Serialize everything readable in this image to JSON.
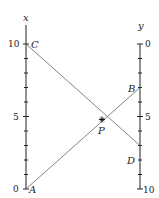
{
  "diagram": {
    "type": "nomogram",
    "left_axis": {
      "label": "x",
      "min": 0,
      "max": 10,
      "tick_labels": [
        "0",
        "5",
        "10"
      ]
    },
    "right_axis": {
      "label": "y",
      "min": 0,
      "max": 10,
      "direction": "downward",
      "tick_labels": [
        "0",
        "5",
        "10"
      ]
    },
    "points": {
      "A": {
        "label": "A",
        "axis": "x",
        "value": 0
      },
      "C": {
        "label": "C",
        "axis": "x",
        "value": 10
      },
      "B": {
        "label": "B",
        "axis": "y",
        "value": 3
      },
      "D": {
        "label": "D",
        "axis": "y",
        "value": 7
      },
      "P": {
        "label": "P",
        "note": "intersection of AB and CD"
      }
    },
    "lines": [
      "A-B",
      "C-D"
    ]
  }
}
